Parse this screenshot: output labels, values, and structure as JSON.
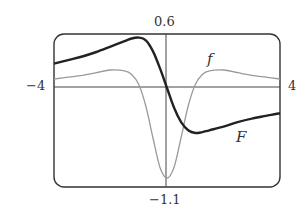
{
  "chart_data": {
    "type": "line",
    "title": "",
    "xlabel": "",
    "ylabel": "",
    "xlim": [
      -4,
      4
    ],
    "ylim": [
      -1.1,
      0.6
    ],
    "grid": false,
    "tick_labels": {
      "x_min": "−4",
      "x_max": "4",
      "y_max": "0.6",
      "y_min": "−1.1"
    },
    "series": [
      {
        "name": "F",
        "style": "thick dark",
        "x": [
          -4,
          -3.5,
          -3,
          -2.5,
          -2,
          -1.5,
          -1.25,
          -1,
          -0.75,
          -0.5,
          -0.25,
          0,
          0.25,
          0.5,
          0.75,
          1,
          1.25,
          1.5,
          2,
          2.5,
          3,
          3.5,
          4
        ],
        "y": [
          0.27,
          0.31,
          0.35,
          0.4,
          0.46,
          0.52,
          0.55,
          0.56,
          0.53,
          0.41,
          0.22,
          0.0,
          -0.22,
          -0.38,
          -0.47,
          -0.5,
          -0.49,
          -0.47,
          -0.43,
          -0.38,
          -0.34,
          -0.31,
          -0.28
        ]
      },
      {
        "name": "f",
        "style": "thin gray",
        "x": [
          -4,
          -3.5,
          -3,
          -2.5,
          -2,
          -1.5,
          -1.25,
          -1,
          -0.75,
          -0.5,
          -0.25,
          0,
          0.25,
          0.5,
          0.75,
          1,
          1.25,
          1.5,
          2,
          2.5,
          3,
          3.5,
          4
        ],
        "y": [
          0.1,
          0.12,
          0.14,
          0.17,
          0.2,
          0.19,
          0.15,
          0.04,
          -0.2,
          -0.55,
          -0.88,
          -1.0,
          -0.88,
          -0.55,
          -0.2,
          0.04,
          0.15,
          0.19,
          0.2,
          0.17,
          0.14,
          0.12,
          0.1
        ]
      }
    ],
    "annotations": [
      {
        "text": "f",
        "x": 1.5,
        "y": 0.35
      },
      {
        "text": "F",
        "x": 2.6,
        "y": -0.6
      }
    ]
  },
  "labels": {
    "y_top": "0.6",
    "y_bottom": "−1.1",
    "x_left": "−4",
    "x_right": "4",
    "curve_f": "f",
    "curve_F": "F"
  }
}
